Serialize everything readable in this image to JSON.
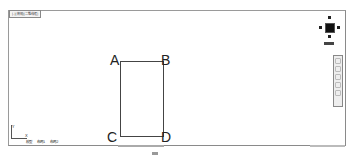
{
  "viewport": {
    "label": "[-][俯视][二维线框]"
  },
  "drawing": {
    "points": [
      {
        "label": "A",
        "x": 110,
        "y": 53
      },
      {
        "label": "B",
        "x": 161,
        "y": 53
      },
      {
        "label": "C",
        "x": 107,
        "y": 130
      },
      {
        "label": "D",
        "x": 161,
        "y": 130
      }
    ],
    "rectangle": {
      "left": 120,
      "top": 61,
      "width": 44,
      "height": 76
    }
  },
  "viewcube": {
    "top": "北",
    "left": "西",
    "right": "东",
    "bottom": "南",
    "wcs_label": "WCS"
  },
  "navbar": {
    "tools": [
      "full-navigation-wheel",
      "pan",
      "zoom",
      "orbit",
      "showmotion"
    ]
  },
  "ucs": {
    "x_label": "X",
    "y_label": "Y"
  },
  "layout_tabs": [
    {
      "label": "模型",
      "active": true
    },
    {
      "label": "布局1",
      "active": false
    },
    {
      "label": "布局2",
      "active": false
    }
  ]
}
